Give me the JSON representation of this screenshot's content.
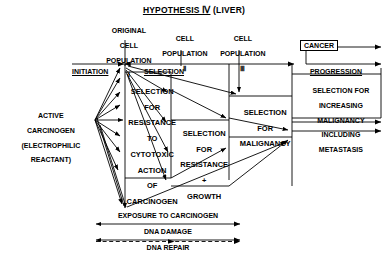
{
  "title": {
    "underlined": "HYPOTHESIS Ⅳ",
    "suffix": " (LIVER)",
    "full": "HYPOTHESIS Ⅳ (LIVER)"
  },
  "stages": {
    "original": {
      "line1": "ORIGINAL",
      "line2": "CELL",
      "line3": "POPULATION",
      "numeral": "Ⅰ"
    },
    "pop2": {
      "line1": "CELL",
      "line2": "POPULATION",
      "numeral": "Ⅱ"
    },
    "pop3": {
      "line1": "CELL",
      "line2": "POPULATION",
      "numeral": "Ⅲ"
    },
    "cancer": {
      "label": "CANCER"
    }
  },
  "phases": {
    "initiation": "INITIATION",
    "selection": "SELECTION",
    "progression": "PROGRESSION"
  },
  "source": {
    "line1": "ACTIVE",
    "line2": "CARCINOGEN",
    "line3": "(ELECTROPHILIC",
    "line4": "REACTANT)"
  },
  "columns": [
    {
      "name": "selection-resistance-cytotoxic",
      "lines": [
        "SELECTION",
        "FOR",
        "RESISTANCE",
        "TO",
        "CYTOTOXIC",
        "ACTION",
        "OF",
        "CARCINOGEN"
      ]
    },
    {
      "name": "selection-resistance-growth",
      "lines": [
        "SELECTION",
        "FOR",
        "RESISTANCE",
        "+",
        "GROWTH"
      ]
    },
    {
      "name": "selection-malignancy",
      "lines": [
        "SELECTION",
        "FOR",
        "MALIGNANCY"
      ]
    },
    {
      "name": "selection-increasing-malignancy",
      "lines": [
        "SELECTION FOR",
        "INCREASING",
        "MALIGNANCY",
        "INCLUDING",
        "METASTASIS"
      ]
    }
  ],
  "timelines": [
    {
      "name": "exposure-to-carcinogen",
      "label": "EXPOSURE TO CARCINOGEN",
      "style": "solid"
    },
    {
      "name": "dna-damage",
      "label": "DNA DAMAGE",
      "style": "solid"
    },
    {
      "name": "dna-repair",
      "label": "DNA REPAIR",
      "style": "dashed"
    }
  ],
  "colors": {
    "ink": "#000000",
    "background": "#ffffff"
  }
}
